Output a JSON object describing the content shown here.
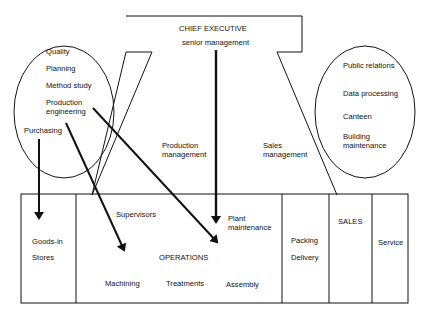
{
  "chief": {
    "title": "CHIEF EXECUTIVE",
    "subtitle": "senior management"
  },
  "left_group": {
    "items": [
      "Quality",
      "Planning",
      "Method study",
      "Production",
      "engineering"
    ],
    "purchasing": "Purchasing"
  },
  "right_group": {
    "items": [
      "Public relations",
      "Data processing",
      "Canteen",
      "Building",
      "maintenance"
    ]
  },
  "middle": {
    "production_management": [
      "Production",
      "management"
    ],
    "sales_management": [
      "Sales",
      "management"
    ]
  },
  "bottom": {
    "goods_in": "Goods-in",
    "stores": "Stores",
    "supervisors": "Supervisors",
    "plant_maintenance": [
      "Plant",
      "maintenance"
    ],
    "operations": "OPERATIONS",
    "machining": "Machining",
    "treatments": "Treatments",
    "assembly": "Assembly",
    "packing": "Packing",
    "delivery": "Delivery",
    "sales": "SALES",
    "service": "Service"
  },
  "colors": {
    "line": "#111111",
    "background": "#ffffff"
  }
}
